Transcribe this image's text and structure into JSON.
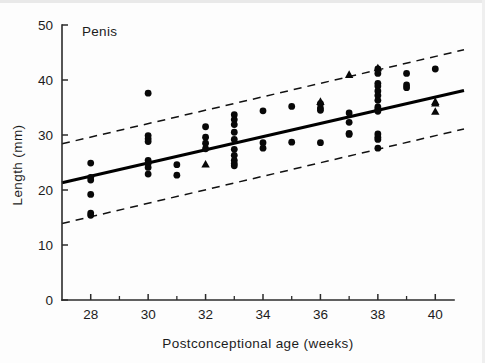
{
  "chart_data": {
    "type": "scatter",
    "title": "Penis",
    "xlabel": "Postconceptional age (weeks)",
    "ylabel": "Length (mm)",
    "xlim": [
      27,
      41
    ],
    "ylim": [
      0,
      50
    ],
    "grid": false,
    "legend": "none",
    "x_ticks": [
      28,
      30,
      32,
      34,
      36,
      38,
      40
    ],
    "x_minor_ticks": [
      29,
      31,
      33,
      35,
      37,
      39
    ],
    "y_ticks": [
      0,
      10,
      20,
      30,
      40,
      50
    ],
    "x_tick_labels": [
      "28",
      "30",
      "32",
      "34",
      "36",
      "38",
      "40"
    ],
    "y_tick_labels": [
      "0",
      "10",
      "20",
      "30",
      "40",
      "50"
    ],
    "series": [
      {
        "name": "measurements-circle",
        "marker": "circle",
        "points": [
          [
            28,
            24.9
          ],
          [
            28,
            22.3
          ],
          [
            28,
            21.8
          ],
          [
            28,
            19.2
          ],
          [
            28,
            15.8
          ],
          [
            28,
            15.4
          ],
          [
            30,
            37.6
          ],
          [
            30,
            29.9
          ],
          [
            30,
            29.3
          ],
          [
            30,
            28.8
          ],
          [
            30,
            25.4
          ],
          [
            30,
            24.8
          ],
          [
            30,
            24.1
          ],
          [
            30,
            22.9
          ],
          [
            31,
            24.6
          ],
          [
            31,
            22.7
          ],
          [
            32,
            31.5
          ],
          [
            32,
            29.6
          ],
          [
            32,
            28.5
          ],
          [
            32,
            27.5
          ],
          [
            33,
            33.7
          ],
          [
            33,
            32.8
          ],
          [
            33,
            31.9
          ],
          [
            33,
            30.5
          ],
          [
            33,
            29.2
          ],
          [
            33,
            27.4
          ],
          [
            33,
            26.3
          ],
          [
            33,
            25.4
          ],
          [
            33,
            24.8
          ],
          [
            33,
            24.4
          ],
          [
            34,
            34.4
          ],
          [
            34,
            28.6
          ],
          [
            34,
            27.6
          ],
          [
            35,
            35.2
          ],
          [
            35,
            28.7
          ],
          [
            36,
            35.7
          ],
          [
            36,
            34.9
          ],
          [
            36,
            34.5
          ],
          [
            36,
            28.6
          ],
          [
            37,
            34.0
          ],
          [
            37,
            32.3
          ],
          [
            37,
            30.3
          ],
          [
            37,
            30.1
          ],
          [
            38,
            42.0
          ],
          [
            38,
            41.2
          ],
          [
            38,
            39.4
          ],
          [
            38,
            38.9
          ],
          [
            38,
            38.0
          ],
          [
            38,
            37.2
          ],
          [
            38,
            36.3
          ],
          [
            38,
            35.1
          ],
          [
            38,
            34.7
          ],
          [
            38,
            34.3
          ],
          [
            38,
            30.2
          ],
          [
            38,
            29.6
          ],
          [
            38,
            29.2
          ],
          [
            38,
            27.6
          ],
          [
            39,
            41.2
          ],
          [
            39,
            39.1
          ],
          [
            39,
            38.6
          ],
          [
            40,
            42.0
          ]
        ]
      },
      {
        "name": "measurements-triangle",
        "marker": "triangle",
        "points": [
          [
            32,
            24.7
          ],
          [
            36,
            36.1
          ],
          [
            37,
            41.0
          ],
          [
            38,
            42.2
          ],
          [
            40,
            36.1
          ],
          [
            40,
            35.8
          ],
          [
            40,
            34.3
          ]
        ]
      }
    ],
    "fit_line": {
      "name": "regression",
      "style": "solid",
      "x": [
        27,
        41
      ],
      "y": [
        21.3,
        38.1
      ]
    },
    "bounds": [
      {
        "name": "upper-prediction-limit",
        "style": "dashed",
        "x": [
          27,
          41
        ],
        "y": [
          28.4,
          45.5
        ]
      },
      {
        "name": "lower-prediction-limit",
        "style": "dashed",
        "x": [
          27,
          41
        ],
        "y": [
          13.9,
          31.1
        ]
      }
    ]
  }
}
